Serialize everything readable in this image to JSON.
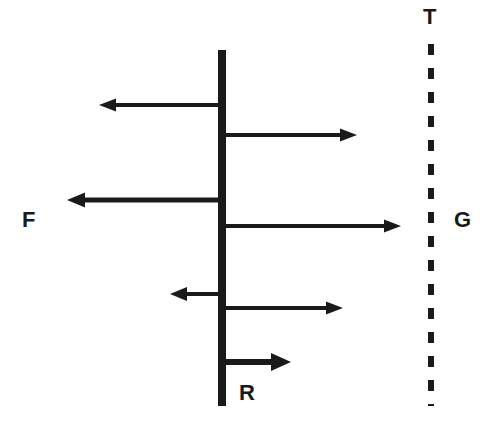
{
  "diagram": {
    "background_color": "#ffffff",
    "stroke_color": "#1a1a1a",
    "labels": {
      "top_right": "T",
      "left": "F",
      "right": "G",
      "bottom_center": "R"
    },
    "solid_boundary": {
      "name": "solid-vertical-line",
      "x": 222,
      "y_top": 50,
      "y_bottom": 406,
      "width": 8,
      "style": "solid"
    },
    "dashed_boundary": {
      "name": "dashed-vertical-line",
      "x": 431,
      "y_top": 44,
      "y_bottom": 406,
      "width": 6,
      "style": "dashed",
      "dash_pattern": "11 13"
    },
    "arrows": [
      {
        "id": "arrow-left-1",
        "direction": "left",
        "x_start": 222,
        "x_end": 100,
        "y": 105,
        "thickness": 4,
        "head_size": "medium"
      },
      {
        "id": "arrow-right-1",
        "direction": "right",
        "x_start": 222,
        "x_end": 356,
        "y": 135,
        "thickness": 4,
        "head_size": "medium"
      },
      {
        "id": "arrow-left-2",
        "direction": "left",
        "x_start": 222,
        "x_end": 68,
        "y": 200,
        "thickness": 5,
        "head_size": "medium"
      },
      {
        "id": "arrow-right-2",
        "direction": "right",
        "x_start": 222,
        "x_end": 400,
        "y": 226,
        "thickness": 4,
        "head_size": "medium"
      },
      {
        "id": "arrow-left-3",
        "direction": "left",
        "x_start": 222,
        "x_end": 171,
        "y": 294,
        "thickness": 4,
        "head_size": "medium"
      },
      {
        "id": "arrow-right-3",
        "direction": "right",
        "x_start": 222,
        "x_end": 342,
        "y": 308,
        "thickness": 4,
        "head_size": "medium"
      },
      {
        "id": "arrow-right-4",
        "direction": "right",
        "x_start": 222,
        "x_end": 290,
        "y": 362,
        "thickness": 6,
        "head_size": "large"
      }
    ]
  }
}
